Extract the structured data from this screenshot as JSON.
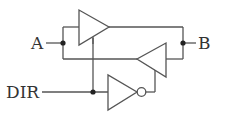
{
  "diagram": {
    "type": "bidirectional-buffer-circuit",
    "labels": {
      "a": "A",
      "b": "B",
      "dir": "DIR"
    },
    "components": [
      {
        "id": "buffer-a-to-b",
        "kind": "tri-state buffer",
        "direction": "right"
      },
      {
        "id": "buffer-b-to-a",
        "kind": "tri-state buffer",
        "direction": "left"
      },
      {
        "id": "dir-inverter",
        "kind": "inverter (NOT gate)",
        "direction": "right"
      }
    ],
    "junctions": [
      "A node",
      "B node",
      "DIR node"
    ],
    "colors": {
      "wire": "#555555",
      "node": "#222222",
      "text": "#333333"
    }
  }
}
